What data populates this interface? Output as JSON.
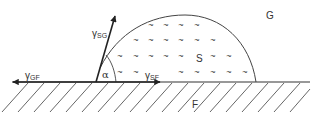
{
  "diagram": {
    "type": "contact-angle / wetting diagram (Young's equation)",
    "regions": {
      "gas": "G",
      "liquid": "S",
      "solid": "F"
    },
    "vectors": {
      "gamma_sg": {
        "symbol": "γ",
        "subscript": "SG"
      },
      "gamma_gf": {
        "symbol": "γ",
        "subscript": "GF"
      },
      "gamma_sf": {
        "symbol": "γ",
        "subscript": "SF"
      }
    },
    "angle": "α",
    "fill_mark": "~",
    "colors": {
      "line": "#333333",
      "background": "#ffffff"
    }
  }
}
